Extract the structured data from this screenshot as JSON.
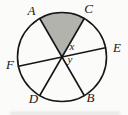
{
  "diagram": {
    "type": "circle-geometry",
    "labels": {
      "A": "A",
      "C": "C",
      "E": "E",
      "F": "F",
      "D": "D",
      "B": "B",
      "x": "x",
      "y": "y"
    },
    "chords": [
      {
        "from": "A",
        "to": "B"
      },
      {
        "from": "C",
        "to": "D"
      },
      {
        "from": "E",
        "to": "F"
      }
    ],
    "shaded_sector": {
      "between": [
        "A",
        "C"
      ],
      "position": "top"
    },
    "angle_marks": [
      {
        "name": "x",
        "between_rays": [
          "C",
          "E"
        ]
      },
      {
        "name": "y",
        "between_rays": [
          "E",
          "B"
        ]
      }
    ]
  },
  "colors": {
    "line": "#161616",
    "label_text": "#161616",
    "shaded_sector": "#b3b3ae",
    "background": "#fbfbf9"
  }
}
